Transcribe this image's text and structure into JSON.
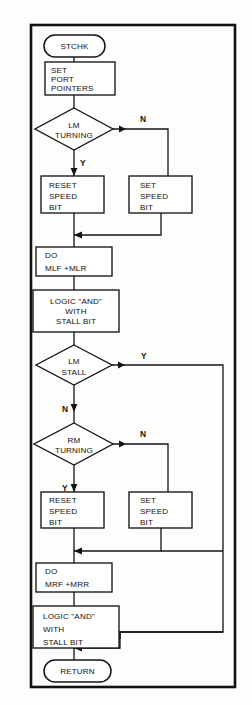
{
  "figure": {
    "type": "flowchart",
    "border_color": "#111111",
    "line_color": "#141414",
    "fill_color": "#ffffff"
  },
  "nodes": {
    "start": {
      "shape": "terminator",
      "text": "STCHK"
    },
    "set_port_pointers": {
      "shape": "process",
      "lines": [
        "SET",
        "PORT",
        "POINTERS"
      ]
    },
    "lm_turning": {
      "shape": "decision",
      "lines": [
        "LM",
        "TURNING"
      ]
    },
    "reset_speed_bit_1": {
      "shape": "process",
      "lines": [
        "RESET",
        "SPEED",
        "BIT"
      ]
    },
    "set_speed_bit_1": {
      "shape": "process",
      "lines": [
        "SET",
        "SPEED",
        "BIT"
      ]
    },
    "do_mlf_mlr": {
      "shape": "process",
      "lines": [
        "DO",
        "MLF +MLR"
      ]
    },
    "logic_and_1": {
      "shape": "process",
      "lines": [
        "LOGIC \"AND\"",
        "WITH",
        "STALL BIT"
      ]
    },
    "lm_stall": {
      "shape": "decision",
      "lines": [
        "LM",
        "STALL"
      ]
    },
    "rm_turning": {
      "shape": "decision",
      "lines": [
        "RM",
        "TURNING"
      ]
    },
    "reset_speed_bit_2": {
      "shape": "process",
      "lines": [
        "RESET",
        "SPEED",
        "BIT"
      ]
    },
    "set_speed_bit_2": {
      "shape": "process",
      "lines": [
        "SET",
        "SPEED",
        "BIT"
      ]
    },
    "do_mrf_mrr": {
      "shape": "process",
      "lines": [
        "DO",
        "MRF +MRR"
      ]
    },
    "logic_and_2": {
      "shape": "process",
      "lines": [
        "LOGIC \"AND\"",
        "WITH",
        "STALL BIT"
      ]
    },
    "end": {
      "shape": "terminator",
      "text": "RETURN"
    }
  },
  "branch_labels": {
    "lm_turning_no": "N",
    "lm_turning_yes": "Y",
    "lm_stall_yes": "Y",
    "lm_stall_no": "N",
    "rm_turning_no": "N",
    "rm_turning_yes": "Y"
  }
}
